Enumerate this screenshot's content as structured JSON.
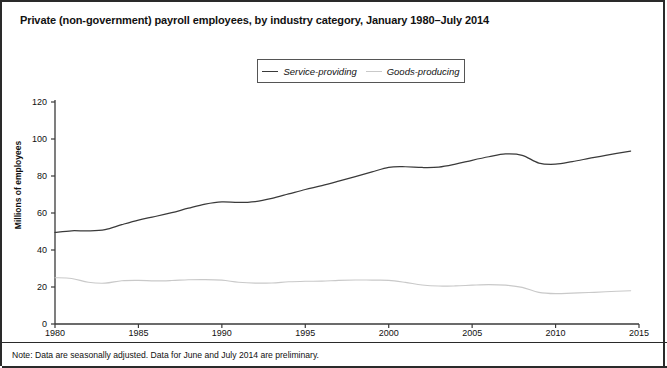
{
  "title": "Private (non-government) payroll employees, by industry category, January 1980–July 2014",
  "note": "Note: Data are seasonally adjusted. Data for June and July 2014 are preliminary.",
  "legend": {
    "position": "top-center",
    "items": [
      {
        "label": "Service-providing",
        "color": "#3a3a3a"
      },
      {
        "label": "Goods-producing",
        "color": "#c9c9c9"
      }
    ]
  },
  "axes": {
    "ylabel": "Millions of employees",
    "xlabel": "",
    "yticks": [
      "0",
      "20",
      "40",
      "60",
      "80",
      "100",
      "120"
    ],
    "xticks": [
      "1980",
      "1985",
      "1990",
      "1995",
      "2000",
      "2005",
      "2010",
      "2015"
    ]
  },
  "chart_data": {
    "type": "line",
    "title": "Private (non-government) payroll employees, by industry category, January 1980–July 2014",
    "xlabel": "",
    "ylabel": "Millions of employees",
    "xlim": [
      1980,
      2015
    ],
    "ylim": [
      0,
      120
    ],
    "ytick_step": 20,
    "xtick_step": 5,
    "grid": false,
    "legend_position": "top-center",
    "x": [
      1980,
      1981,
      1982,
      1983,
      1984,
      1985,
      1986,
      1987,
      1988,
      1989,
      1990,
      1991,
      1992,
      1993,
      1994,
      1995,
      1996,
      1997,
      1998,
      1999,
      2000,
      2001,
      2002,
      2003,
      2004,
      2005,
      2006,
      2007,
      2008,
      2009,
      2010,
      2011,
      2012,
      2013,
      2014.5
    ],
    "series": [
      {
        "name": "Service-providing",
        "color": "#3a3a3a",
        "values": [
          49.5,
          50.4,
          50.3,
          51.0,
          53.7,
          56.2,
          58.1,
          60.2,
          62.6,
          64.8,
          66.0,
          65.7,
          66.2,
          67.9,
          70.3,
          72.7,
          74.8,
          77.2,
          79.7,
          82.2,
          84.7,
          85.0,
          84.6,
          84.8,
          86.4,
          88.5,
          90.4,
          91.9,
          91.2,
          87.0,
          86.4,
          87.8,
          89.5,
          91.2,
          93.5
        ]
      },
      {
        "name": "Goods-producing",
        "color": "#c9c9c9",
        "values": [
          25.0,
          24.6,
          22.6,
          22.1,
          23.4,
          23.6,
          23.3,
          23.5,
          23.9,
          24.0,
          23.7,
          22.6,
          22.1,
          22.2,
          22.8,
          23.1,
          23.2,
          23.6,
          23.8,
          23.7,
          23.6,
          22.5,
          21.1,
          20.5,
          20.6,
          21.0,
          21.3,
          21.0,
          19.8,
          17.1,
          16.4,
          16.7,
          17.0,
          17.4,
          18.0
        ]
      }
    ]
  }
}
